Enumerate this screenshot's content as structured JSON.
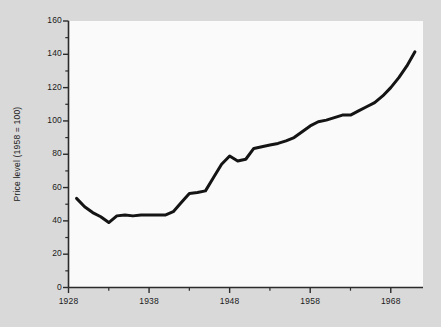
{
  "figure": {
    "background_color": "#d9d9d9",
    "plot_background_color": "#fafafa",
    "line_color": "#141414",
    "axis_color": "#2b2b2b"
  },
  "chart_data": {
    "type": "line",
    "title": "",
    "xlabel": "",
    "ylabel": "Price level (1958 = 100)",
    "xlim": [
      1928,
      1972
    ],
    "ylim": [
      0,
      160
    ],
    "grid": false,
    "legend": null,
    "x_major_ticks": [
      1928,
      1938,
      1948,
      1958,
      1968
    ],
    "x_minor_ticks": [
      1933,
      1943,
      1953,
      1963
    ],
    "x_tick_labels": [
      "1928",
      "1938",
      "1948",
      "1958",
      "1968"
    ],
    "y_major_ticks": [
      0,
      20,
      40,
      60,
      80,
      100,
      120,
      140,
      160
    ],
    "y_minor_ticks": [
      10,
      30,
      50,
      70,
      90,
      110,
      130,
      150
    ],
    "y_tick_labels": [
      "0",
      "20",
      "40",
      "60",
      "80",
      "100",
      "120",
      "140",
      "160"
    ],
    "series": [
      {
        "name": "Price level",
        "x": [
          1929,
          1930,
          1931,
          1932,
          1933,
          1934,
          1935,
          1936,
          1937,
          1938,
          1939,
          1940,
          1941,
          1942,
          1943,
          1944,
          1945,
          1946,
          1947,
          1948,
          1949,
          1950,
          1951,
          1952,
          1953,
          1954,
          1955,
          1956,
          1957,
          1958,
          1959,
          1960,
          1961,
          1962,
          1963,
          1964,
          1965,
          1966,
          1967,
          1968,
          1969,
          1970,
          1971
        ],
        "y": [
          53.5,
          48.5,
          45.0,
          42.5,
          39.0,
          43.0,
          43.5,
          43.0,
          43.5,
          43.5,
          43.5,
          43.5,
          45.5,
          51.0,
          56.5,
          57.0,
          58.0,
          66.0,
          74.0,
          79.0,
          76.0,
          77.0,
          83.5,
          84.5,
          85.5,
          86.5,
          88.0,
          90.0,
          93.5,
          97.0,
          99.5,
          100.5,
          102.0,
          103.5,
          103.5,
          106.0,
          108.5,
          111.0,
          115.0,
          120.0,
          126.0,
          133.0,
          141.5
        ]
      }
    ]
  }
}
